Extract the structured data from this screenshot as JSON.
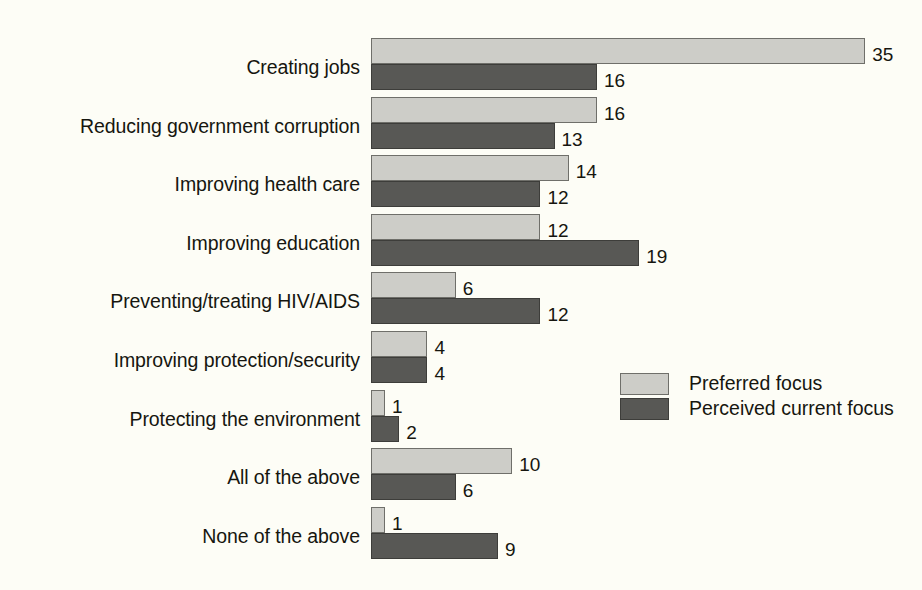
{
  "chart_data": {
    "type": "bar",
    "orientation": "horizontal",
    "title": "",
    "subtitle": "",
    "xlabel": "",
    "ylabel": "",
    "grid": false,
    "xlim": [
      0,
      35
    ],
    "legend_position": "middle-right",
    "categories": [
      "Creating jobs",
      "Reducing government corruption",
      "Improving health care",
      "Improving education",
      "Preventing/treating HIV/AIDS",
      "Improving protection/security",
      "Protecting the environment",
      "All of the above",
      "None of the above"
    ],
    "series": [
      {
        "name": "Preferred focus",
        "color": "#cdcdc8",
        "values": [
          35,
          16,
          14,
          12,
          6,
          4,
          1,
          10,
          1
        ]
      },
      {
        "name": "Perceived current focus",
        "color": "#585855",
        "values": [
          16,
          13,
          12,
          19,
          12,
          4,
          2,
          6,
          9
        ]
      }
    ],
    "background_color": "#fdfdf6",
    "text_color": "#16160f"
  },
  "legend": {
    "items": [
      {
        "label": "Preferred focus",
        "swatch": "light-gray-swatch"
      },
      {
        "label": "Perceived current focus",
        "swatch": "dark-gray-swatch"
      }
    ]
  }
}
